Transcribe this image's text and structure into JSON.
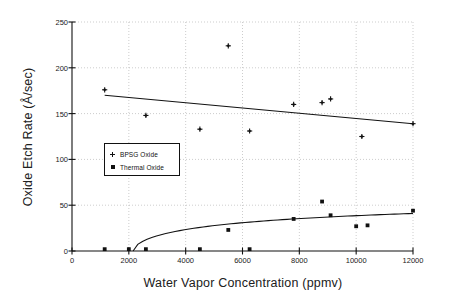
{
  "chart_data": {
    "type": "scatter",
    "title": "",
    "xlabel": "Water Vapor Concentration (ppmv)",
    "ylabel": "Oxide Etch Rate  (Å/sec)",
    "xlim": [
      0,
      12000
    ],
    "ylim": [
      0,
      250
    ],
    "xticks": [
      0,
      2000,
      4000,
      6000,
      8000,
      10000,
      12000
    ],
    "yticks": [
      0,
      50,
      100,
      150,
      200,
      250
    ],
    "xtick_labels": [
      "0",
      "2000",
      "4000",
      "6000",
      "8000",
      "10000",
      "12000"
    ],
    "ytick_labels": [
      "0",
      "50",
      "100",
      "150",
      "200",
      "250"
    ],
    "grid": true,
    "grid_style": "dotted",
    "legend_position": "center-left",
    "series": [
      {
        "name": "BPSG Oxide",
        "marker": "plus",
        "color": "#111111",
        "points": [
          {
            "x": 1150,
            "y": 176
          },
          {
            "x": 2600,
            "y": 148
          },
          {
            "x": 4500,
            "y": 133
          },
          {
            "x": 5500,
            "y": 224
          },
          {
            "x": 6250,
            "y": 131
          },
          {
            "x": 7800,
            "y": 160
          },
          {
            "x": 8800,
            "y": 162
          },
          {
            "x": 9100,
            "y": 166
          },
          {
            "x": 10200,
            "y": 125
          },
          {
            "x": 12000,
            "y": 139
          }
        ],
        "fit_line": {
          "type": "linear",
          "x0": 1150,
          "y0": 170,
          "x1": 12000,
          "y1": 139
        }
      },
      {
        "name": "Thermal Oxide",
        "marker": "square",
        "color": "#111111",
        "points": [
          {
            "x": 1150,
            "y": 2
          },
          {
            "x": 2000,
            "y": 2
          },
          {
            "x": 2600,
            "y": 2
          },
          {
            "x": 4500,
            "y": 2
          },
          {
            "x": 5500,
            "y": 23
          },
          {
            "x": 6250,
            "y": 2
          },
          {
            "x": 7800,
            "y": 35
          },
          {
            "x": 8800,
            "y": 54
          },
          {
            "x": 9100,
            "y": 39
          },
          {
            "x": 10000,
            "y": 27
          },
          {
            "x": 10400,
            "y": 28
          },
          {
            "x": 12000,
            "y": 44
          }
        ],
        "fit_curve": {
          "type": "log",
          "x_start": 2150,
          "x_end": 12000,
          "y_start": 0,
          "y_end": 41
        }
      }
    ]
  },
  "legend": {
    "items": [
      {
        "label": "BPSG Oxide",
        "marker": "plus"
      },
      {
        "label": "Thermal Oxide",
        "marker": "square"
      }
    ]
  }
}
